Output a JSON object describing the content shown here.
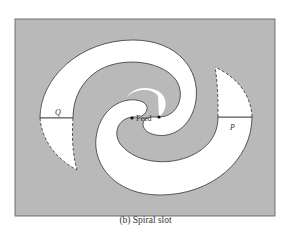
{
  "figure": {
    "caption": "(b)  Spiral slot",
    "labels": {
      "feed": "Feed",
      "left_port": "Q",
      "right_port": "P"
    },
    "colors": {
      "background": "#ffffff",
      "ground_plane": "#b9b9b9",
      "slot": "#ffffff",
      "outline": "#333333"
    }
  }
}
